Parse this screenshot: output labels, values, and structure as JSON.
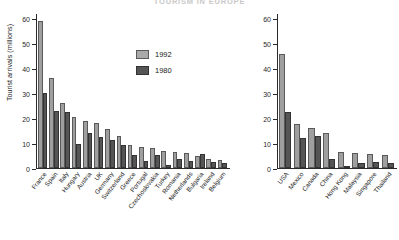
{
  "figure": {
    "title": "TOURISM IN EUROPE",
    "ylabel": "Tourist arrivals (millions)",
    "legend": [
      {
        "key": "y1992",
        "label": "1992",
        "color": "#9f9f9f"
      },
      {
        "key": "y1980",
        "label": "1980",
        "color": "#555555"
      }
    ]
  },
  "chart_data": [
    {
      "type": "bar",
      "panel": "left",
      "title": "",
      "xlabel": "",
      "ylabel": "Tourist arrivals (millions)",
      "ylim": [
        0,
        62
      ],
      "yticks": [
        0,
        10,
        20,
        30,
        40,
        50,
        60
      ],
      "ytick_labels": [
        "0",
        "10",
        "20",
        "30",
        "40",
        "50",
        "60"
      ],
      "grid": false,
      "legend_position": "inside-top-right",
      "categories": [
        "France",
        "Spain",
        "Italy",
        "Hungary",
        "Austria",
        "UK",
        "Germany",
        "Switzerland",
        "Greece",
        "Portugal",
        "Czechoslovakia",
        "Turkey",
        "Romania",
        "Netherlands",
        "Bulgaria",
        "Ireland",
        "Belgium"
      ],
      "series": [
        {
          "name": "1992",
          "color": "#9f9f9f",
          "values": [
            59.0,
            36.0,
            26.0,
            20.5,
            19.0,
            18.0,
            15.5,
            13.0,
            9.3,
            8.5,
            8.0,
            7.0,
            6.3,
            6.0,
            5.0,
            3.7,
            3.2
          ]
        },
        {
          "name": "1980",
          "color": "#555555",
          "values": [
            30.0,
            23.0,
            22.3,
            9.5,
            13.9,
            12.4,
            11.1,
            9.3,
            5.3,
            2.7,
            5.1,
            1.3,
            3.6,
            2.8,
            5.5,
            2.3,
            2.2
          ]
        }
      ]
    },
    {
      "type": "bar",
      "panel": "right",
      "title": "",
      "xlabel": "",
      "ylabel": "",
      "ylim": [
        0,
        62
      ],
      "yticks": [
        0,
        10,
        20,
        30,
        40,
        50,
        60
      ],
      "ytick_labels": [
        "0",
        "10",
        "20",
        "30",
        "40",
        "50",
        "60"
      ],
      "grid": false,
      "legend_position": "none",
      "categories": [
        "USA",
        "Mexico",
        "Canada",
        "China",
        "Hong Kong",
        "Malaysia",
        "Singapore",
        "Thailand"
      ],
      "series": [
        {
          "name": "1992",
          "color": "#9f9f9f",
          "values": [
            45.5,
            17.5,
            16.0,
            14.0,
            6.5,
            6.0,
            5.5,
            5.1
          ]
        },
        {
          "name": "1980",
          "color": "#555555",
          "values": [
            22.5,
            12.0,
            13.0,
            3.5,
            1.0,
            2.0,
            2.6,
            1.9
          ]
        }
      ]
    }
  ]
}
